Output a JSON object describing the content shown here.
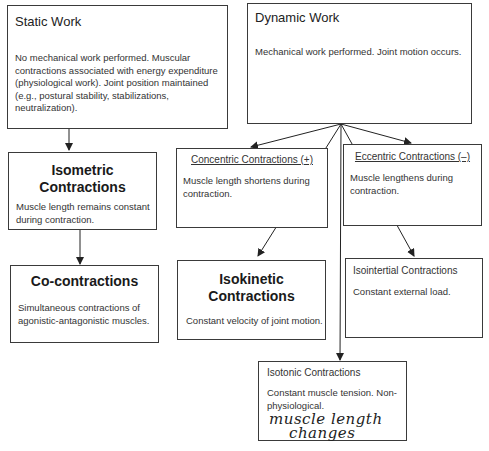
{
  "diagram": {
    "static_work": {
      "title": "Static Work",
      "description": "No mechanical work performed. Muscular contractions associated with energy expenditure (physiological work). Joint position maintained (e.g., postural stability, stabilizations, neutralization)."
    },
    "dynamic_work": {
      "title": "Dynamic Work",
      "description": "Mechanical work performed. Joint motion occurs."
    },
    "isometric": {
      "title": "Isometric Contractions",
      "description": "Muscle length remains constant during contraction."
    },
    "co_contractions": {
      "title": "Co-contractions",
      "description": "Simultaneous contractions of agonistic-antagonistic muscles."
    },
    "concentric": {
      "title": "Concentric Contractions (+)",
      "description": "Muscle length shortens during contraction."
    },
    "eccentric": {
      "title": "Eccentric Contractions (–)",
      "description": "Muscle lengthens during contraction."
    },
    "isokinetic": {
      "title": "Isokinetic Contractions",
      "description": "Constant velocity of joint motion."
    },
    "isointertial": {
      "title": "Isointertial Contractions",
      "description": "Constant external load."
    },
    "isotonic": {
      "title": "Isotonic Contractions",
      "description": "Constant muscle tension. Non-physiological.",
      "handwritten_note_line1": "muscle length",
      "handwritten_note_line2": "changes"
    }
  }
}
